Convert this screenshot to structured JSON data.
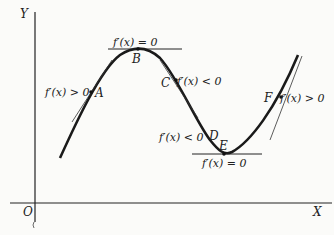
{
  "figure": {
    "axes": {
      "y_label": "Y",
      "x_label": "X",
      "origin_label": "O"
    },
    "points": [
      {
        "id": "A",
        "label": "A",
        "annotation": "f′(x) > 0"
      },
      {
        "id": "B",
        "label": "B",
        "annotation": "f′(x) = 0"
      },
      {
        "id": "C",
        "label": "C",
        "annotation": "f′(x) < 0"
      },
      {
        "id": "D",
        "label": "D",
        "annotation": "f′(x) < 0"
      },
      {
        "id": "E",
        "label": "E",
        "annotation": "f′(x) = 0"
      },
      {
        "id": "F",
        "label": "F",
        "annotation": "f′(x) > 0"
      }
    ],
    "colors": {
      "ink": "#222222",
      "background": "#fbfbf9"
    }
  }
}
